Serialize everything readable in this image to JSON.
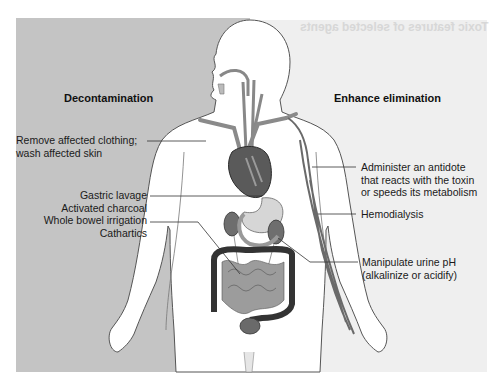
{
  "background_bleed_text": "Toxic features of selected agents",
  "colors": {
    "left_panel": "#c4c4c4",
    "right_panel": "#efefef",
    "body_fill": "#ffffff",
    "outline": "#555555",
    "organ_dark": "#3a3a3a",
    "organ_mid": "#8a8a8a",
    "organ_light": "#d0d0d0"
  },
  "left": {
    "heading": "Decontamination",
    "labels": [
      {
        "lines": [
          "Remove affected clothing;",
          "wash affected skin"
        ]
      },
      {
        "lines": [
          "Gastric lavage",
          "Activated charcoal",
          "Whole bowel irrigation",
          "Cathartics"
        ]
      }
    ]
  },
  "right": {
    "heading": "Enhance elimination",
    "labels": [
      {
        "lines": [
          "Administer an antidote",
          "that reacts with the toxin",
          "or speeds its metabolism"
        ]
      },
      {
        "lines": [
          "Hemodialysis"
        ]
      },
      {
        "lines": [
          "Manipulate urine pH",
          "(alkalinize or acidify)"
        ]
      }
    ]
  },
  "figure": {
    "organs": [
      "airway",
      "esophagus",
      "heart",
      "aorta",
      "stomach",
      "kidneys",
      "colon",
      "small intestine",
      "bladder",
      "arm veins"
    ]
  }
}
